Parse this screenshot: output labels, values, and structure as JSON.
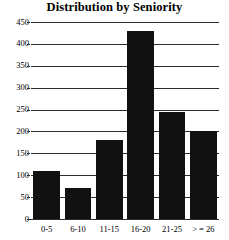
{
  "chart_data": {
    "type": "bar",
    "title": "Distribution by Seniority",
    "xlabel": "",
    "ylabel": "",
    "categories": [
      "0-5",
      "6-10",
      "11-15",
      "16-20",
      "21-25",
      "> = 26"
    ],
    "values": [
      110,
      70,
      180,
      430,
      245,
      200
    ],
    "ylim": [
      0,
      450
    ],
    "yticks": [
      0,
      50,
      100,
      150,
      200,
      250,
      300,
      350,
      400,
      450
    ],
    "ytick_labels": [
      "0",
      "50",
      "100",
      "150",
      "200",
      "250",
      "300",
      "350",
      "400",
      "450"
    ],
    "grid": true,
    "legend": false,
    "bar_color": "#111111",
    "gridline_color": "#2b2b2b",
    "background_color": "#ffffff"
  }
}
